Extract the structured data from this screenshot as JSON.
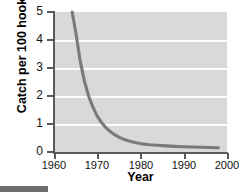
{
  "chart_data": {
    "type": "line",
    "title": "",
    "xlabel": "Year",
    "ylabel": "Catch per 100 hooks",
    "xlim": [
      1960,
      2000
    ],
    "ylim": [
      0,
      5
    ],
    "xticks": [
      1960,
      1970,
      1980,
      1990,
      2000
    ],
    "yticks": [
      0,
      1,
      2,
      3,
      4,
      5
    ],
    "grid": "horizontal-white",
    "legend": "none",
    "series": [
      {
        "name": "Catch per 100 hooks",
        "color": "#7a7a7a",
        "x": [
          1964.2,
          1965,
          1966,
          1967,
          1968,
          1969,
          1970,
          1971,
          1972,
          1973,
          1974,
          1975,
          1976,
          1977,
          1978,
          1979,
          1980,
          1982,
          1984,
          1986,
          1988,
          1990,
          1992,
          1994,
          1996,
          1998
        ],
        "y": [
          5.0,
          4.3,
          3.3,
          2.55,
          2.0,
          1.6,
          1.28,
          1.05,
          0.87,
          0.73,
          0.62,
          0.53,
          0.46,
          0.41,
          0.37,
          0.33,
          0.3,
          0.26,
          0.24,
          0.22,
          0.2,
          0.19,
          0.18,
          0.17,
          0.16,
          0.15
        ]
      }
    ]
  },
  "axes": {
    "yticks": [
      {
        "label": "5",
        "value": 5
      },
      {
        "label": "4",
        "value": 4
      },
      {
        "label": "3",
        "value": 3
      },
      {
        "label": "2",
        "value": 2
      },
      {
        "label": "1",
        "value": 1
      },
      {
        "label": "0",
        "value": 0
      }
    ],
    "xticks": [
      {
        "label": "1960",
        "value": 1960
      },
      {
        "label": "1970",
        "value": 1970
      },
      {
        "label": "1980",
        "value": 1980
      },
      {
        "label": "1990",
        "value": 1990
      },
      {
        "label": "2000",
        "value": 2000
      }
    ],
    "ylabel": "Catch per 100 hooks",
    "xlabel": "Year"
  },
  "colors": {
    "plot_background": "#d9d9d9",
    "gridline": "#fdfdfd",
    "axis": "#5a5a5a",
    "curve": "#7a7a7a",
    "page_background": "#ffffff",
    "crop_bar": "#6e6e6e"
  }
}
